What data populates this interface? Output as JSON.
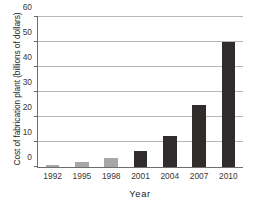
{
  "chart_data": {
    "type": "bar",
    "title": "",
    "xlabel": "Year",
    "ylabel": "Cost of fabrication plant (billions of dollars)",
    "categories": [
      "1992",
      "1995",
      "1998",
      "2001",
      "2004",
      "2007",
      "2010"
    ],
    "values": [
      1,
      2,
      3.5,
      6.5,
      12.5,
      25,
      50
    ],
    "bar_colors": [
      "#a9a7a6",
      "#a9a7a6",
      "#a9a7a6",
      "#2f2c2b",
      "#2f2c2b",
      "#2f2c2b",
      "#2f2c2b"
    ],
    "ylim": [
      0,
      60
    ],
    "yticks": [
      0,
      10,
      20,
      30,
      40,
      50,
      60
    ],
    "ytick_labels": [
      "0",
      "10",
      "20",
      "30",
      "40",
      "50",
      "60"
    ],
    "grid": true,
    "grid_axis": "y",
    "legend": null,
    "legend_position": "none",
    "axis_color": "#6f6d6c",
    "grid_color": "#b9b7b6",
    "text_color": "#201d1c"
  }
}
